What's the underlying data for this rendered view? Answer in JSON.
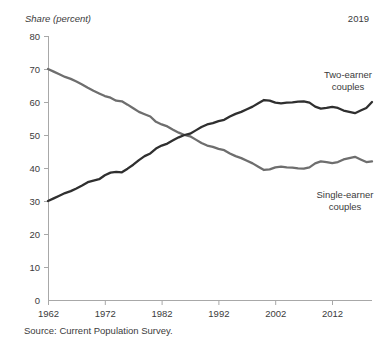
{
  "figure": {
    "title_fragment": "g",
    "axis_note": "Share (percent)",
    "end_year_note": "2019",
    "source": "Source: Current Population Survey."
  },
  "chart_data": {
    "type": "line",
    "title": "",
    "xlabel": "",
    "ylabel": "Share (percent)",
    "xlim": [
      1962,
      2019
    ],
    "ylim": [
      0,
      80
    ],
    "ytick_labels": [
      "0",
      "10",
      "20",
      "30",
      "40",
      "50",
      "60",
      "70",
      "80"
    ],
    "yticks": [
      0,
      10,
      20,
      30,
      40,
      50,
      60,
      70,
      80
    ],
    "xtick_labels": [
      "1962",
      "1972",
      "1982",
      "1992",
      "2002",
      "2012"
    ],
    "xticks": [
      1962,
      1972,
      1982,
      1992,
      2002,
      2012
    ],
    "grid": false,
    "legend_position": "inline-annotation",
    "x": [
      1962,
      1963,
      1964,
      1965,
      1966,
      1967,
      1968,
      1969,
      1970,
      1971,
      1972,
      1973,
      1974,
      1975,
      1976,
      1977,
      1978,
      1979,
      1980,
      1981,
      1982,
      1983,
      1984,
      1985,
      1986,
      1987,
      1988,
      1989,
      1990,
      1991,
      1992,
      1993,
      1994,
      1995,
      1996,
      1997,
      1998,
      1999,
      2000,
      2001,
      2002,
      2003,
      2004,
      2005,
      2006,
      2007,
      2008,
      2009,
      2010,
      2011,
      2012,
      2013,
      2014,
      2015,
      2016,
      2017,
      2018,
      2019
    ],
    "series": [
      {
        "name": "Single-earner couples",
        "color": "#6e6e6e",
        "label_lines": [
          "Single-earner",
          "couples"
        ],
        "values": [
          70.0,
          69.2,
          68.4,
          67.6,
          67.0,
          66.2,
          65.3,
          64.3,
          63.4,
          62.6,
          61.8,
          61.3,
          60.4,
          60.2,
          59.2,
          58.1,
          57.0,
          56.3,
          55.6,
          54.0,
          53.2,
          52.6,
          51.6,
          50.7,
          50.0,
          49.6,
          48.6,
          47.6,
          46.8,
          46.4,
          45.8,
          45.4,
          44.4,
          43.6,
          43.0,
          42.2,
          41.4,
          40.4,
          39.4,
          39.6,
          40.2,
          40.4,
          40.2,
          40.1,
          39.9,
          39.8,
          40.2,
          41.4,
          42.0,
          41.8,
          41.5,
          41.8,
          42.6,
          43.0,
          43.4,
          42.6,
          41.8,
          42.0
        ]
      },
      {
        "name": "Two-earner couples",
        "color": "#2f2f2f",
        "label_lines": [
          "Two-earner",
          "couples"
        ],
        "values": [
          30.0,
          30.8,
          31.6,
          32.4,
          33.0,
          33.8,
          34.7,
          35.7,
          36.2,
          36.6,
          37.8,
          38.6,
          38.8,
          38.7,
          39.8,
          41.0,
          42.4,
          43.6,
          44.4,
          45.9,
          46.8,
          47.4,
          48.4,
          49.3,
          50.0,
          50.4,
          51.4,
          52.4,
          53.2,
          53.6,
          54.2,
          54.6,
          55.6,
          56.4,
          57.0,
          57.8,
          58.6,
          59.6,
          60.6,
          60.4,
          59.8,
          59.6,
          59.8,
          59.9,
          60.1,
          60.2,
          59.8,
          58.6,
          58.0,
          58.2,
          58.5,
          58.2,
          57.4,
          57.0,
          56.6,
          57.4,
          58.2,
          60.0
        ]
      }
    ],
    "annotations": [
      {
        "text": "2019",
        "position": "top-right"
      }
    ]
  },
  "layout": {
    "plot_left": 48,
    "plot_right": 372,
    "plot_top": 36,
    "plot_bottom": 300
  }
}
